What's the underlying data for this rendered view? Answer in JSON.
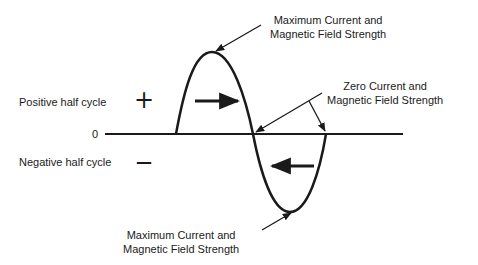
{
  "diagram": {
    "title": "",
    "labels": {
      "max_top_line1": "Maximum Current and",
      "max_top_line2": "Magnetic Field Strength",
      "zero_line1": "Zero Current and",
      "zero_line2": "Magnetic Field Strength",
      "max_bottom_line1": "Maximum Current and",
      "max_bottom_line2": "Magnetic Field Strength",
      "positive": "Positive half cycle",
      "negative": "Negative half cycle",
      "positive_symbol": "+",
      "negative_symbol": "—",
      "zero": "0"
    },
    "colors": {
      "stroke": "#1a1a1a",
      "background": "#ffffff"
    },
    "waveform": {
      "type": "sine",
      "cycles": 1,
      "baseline_y_px": 134,
      "positive_peak": "Maximum current (positive)",
      "negative_peak": "Maximum current (negative)",
      "zero_crossing": "Zero current"
    }
  }
}
